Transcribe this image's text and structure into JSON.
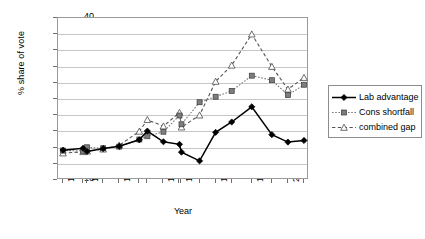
{
  "chart_data": {
    "type": "line",
    "title": "",
    "xlabel": "Year",
    "ylabel": "% share of vote",
    "ylim": [
      -10,
      40
    ],
    "ytick_step": 5,
    "yticks": [
      "40",
      "35",
      "30",
      "25",
      "20",
      "15",
      "10",
      "5",
      "0",
      "-5",
      "-10"
    ],
    "grid": true,
    "legend_position": "right",
    "x": [
      1945,
      1950,
      1951,
      1955,
      1959,
      1964,
      1966,
      1970,
      1974,
      1974.5,
      1979,
      1983,
      1987,
      1992,
      1997,
      2001,
      2005
    ],
    "xtick_labels": [
      "1945",
      "1951",
      "1959",
      "1970",
      "1975",
      "1983",
      "1992",
      "2001"
    ],
    "xtick_indices": [
      0,
      2,
      4,
      7,
      9,
      11,
      13,
      15
    ],
    "series": [
      {
        "name": "Lab advantage",
        "marker": "filled-diamond",
        "line": "solid",
        "color": "#000000",
        "values": [
          -0.8,
          -0.2,
          -1.2,
          -0.3,
          0.4,
          2.4,
          5.1,
          1.8,
          1.0,
          -1.4,
          -4.1,
          4.7,
          7.9,
          12.6,
          4.0,
          1.7,
          2.2
        ]
      },
      {
        "name": "Cons shortfall",
        "marker": "filled-square",
        "line": "dotted",
        "color": "#7a7a7a",
        "values": [
          -0.9,
          -1.0,
          0.1,
          -0.2,
          0.3,
          2.5,
          3.5,
          4.9,
          9.9,
          7.2,
          14.0,
          15.7,
          17.5,
          22.2,
          20.8,
          16.2,
          19.4
        ]
      },
      {
        "name": "combined gap",
        "marker": "open-triangle",
        "line": "dashed",
        "color": "#555555",
        "values": [
          -1.7,
          -1.3,
          -1.1,
          -0.5,
          0.7,
          5.0,
          8.6,
          6.6,
          10.8,
          6.3,
          10.0,
          20.4,
          25.4,
          35.0,
          25.0,
          18.0,
          21.6
        ]
      }
    ]
  },
  "legend": {
    "items": [
      {
        "label": "Lab advantage"
      },
      {
        "label": "Cons shortfall"
      },
      {
        "label": "combined gap"
      }
    ]
  }
}
